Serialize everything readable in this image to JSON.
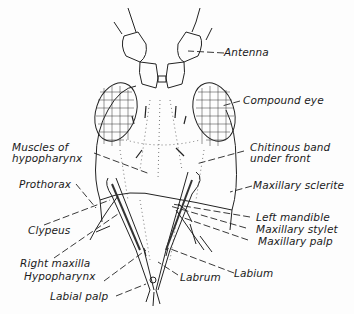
{
  "diagram": {
    "labels": {
      "antenna": "Antenna",
      "compound_eye": "Compound eye",
      "muscles_line1": "Muscles of",
      "muscles_line2": "hypopharynx",
      "chitinous_line1": "Chitinous band",
      "chitinous_line2": "under front",
      "prothorax": "Prothorax",
      "maxillary_sclerite": "Maxillary sclerite",
      "left_mandible": "Left mandible",
      "clypeus": "Clypeus",
      "maxillary_stylet": "Maxillary stylet",
      "maxillary_palp": "Maxillary palp",
      "right_maxilla": "Right maxilla",
      "labium": "Labium",
      "hypopharynx": "Hypopharynx",
      "labrum": "Labrum",
      "labial_palp": "Labial palp"
    }
  }
}
